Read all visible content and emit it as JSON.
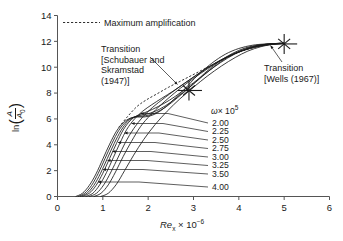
{
  "chart_data": {
    "type": "line",
    "title": "",
    "xlabel": "Re_x × 10⁻⁶",
    "ylabel": "ln(A/A₀)",
    "xlim": [
      0,
      6
    ],
    "ylim": [
      0,
      14
    ],
    "xticks": [
      "0",
      "1",
      "2",
      "3",
      "4",
      "5",
      "6"
    ],
    "yticks": [
      "0",
      "2",
      "4",
      "6",
      "8",
      "10",
      "12",
      "14"
    ],
    "grid": false,
    "legend_position": "top-left",
    "series_group_label": "ω × 10⁵",
    "series": [
      {
        "name": "2.00",
        "x": [
          0.4,
          0.55,
          0.7,
          0.85,
          1.0,
          1.15,
          1.3,
          1.45,
          1.6,
          1.75,
          1.9,
          2.1,
          2.3,
          2.55,
          2.8,
          3.1,
          3.4,
          3.7,
          4.0,
          4.3,
          4.6,
          5.0
        ],
        "values": [
          0.0,
          0.25,
          0.85,
          1.75,
          2.9,
          4.05,
          5.05,
          5.7,
          6.05,
          6.15,
          6.15,
          6.3,
          6.7,
          7.45,
          8.3,
          9.4,
          10.3,
          11.0,
          11.45,
          11.7,
          11.8,
          11.85
        ]
      },
      {
        "name": "2.25",
        "x": [
          0.45,
          0.6,
          0.75,
          0.9,
          1.05,
          1.2,
          1.35,
          1.5,
          1.65,
          1.8,
          1.95,
          2.15,
          2.4,
          2.65,
          2.95,
          3.25,
          3.55,
          3.85,
          4.15,
          4.45,
          4.75,
          5.0
        ],
        "values": [
          0.0,
          0.25,
          0.85,
          1.8,
          2.95,
          4.1,
          5.1,
          5.75,
          6.1,
          6.2,
          6.25,
          6.45,
          6.95,
          7.65,
          8.55,
          9.55,
          10.4,
          11.05,
          11.5,
          11.72,
          11.82,
          11.85
        ]
      },
      {
        "name": "2.50",
        "x": [
          0.5,
          0.65,
          0.8,
          0.95,
          1.1,
          1.25,
          1.4,
          1.55,
          1.7,
          1.85,
          2.0,
          2.25,
          2.5,
          2.75,
          3.05,
          3.35,
          3.65,
          3.95,
          4.25,
          4.55,
          4.8,
          5.0
        ],
        "values": [
          0.0,
          0.25,
          0.85,
          1.8,
          2.95,
          4.1,
          5.1,
          5.8,
          6.15,
          6.3,
          6.4,
          6.75,
          7.3,
          8.0,
          8.85,
          9.75,
          10.55,
          11.15,
          11.55,
          11.75,
          11.83,
          11.85
        ]
      },
      {
        "name": "2.75",
        "x": [
          0.55,
          0.7,
          0.85,
          1.0,
          1.15,
          1.3,
          1.45,
          1.6,
          1.75,
          1.9,
          2.1,
          2.35,
          2.6,
          2.85,
          3.15,
          3.45,
          3.75,
          4.05,
          4.35,
          4.62,
          4.85,
          5.0
        ],
        "values": [
          0.0,
          0.25,
          0.85,
          1.8,
          2.95,
          4.1,
          5.15,
          5.85,
          6.25,
          6.45,
          6.75,
          7.2,
          7.75,
          8.4,
          9.2,
          10.0,
          10.7,
          11.25,
          11.6,
          11.78,
          11.84,
          11.85
        ]
      },
      {
        "name": "3.00",
        "x": [
          0.62,
          0.78,
          0.93,
          1.08,
          1.23,
          1.38,
          1.53,
          1.7,
          1.88,
          2.08,
          2.3,
          2.55,
          2.8,
          3.05,
          3.35,
          3.65,
          3.95,
          4.25,
          4.5,
          4.75,
          5.0
        ],
        "values": [
          0.0,
          0.25,
          0.9,
          1.85,
          3.0,
          4.15,
          5.2,
          6.0,
          6.6,
          7.1,
          7.6,
          8.15,
          8.75,
          9.35,
          10.05,
          10.65,
          11.1,
          11.45,
          11.65,
          11.78,
          11.85
        ]
      },
      {
        "name": "3.25",
        "x": [
          0.7,
          0.86,
          1.02,
          1.18,
          1.34,
          1.5,
          1.68,
          1.88,
          2.1,
          2.35,
          2.6,
          2.88,
          3.15,
          3.45,
          3.75,
          4.05,
          4.32,
          4.58,
          4.8,
          5.0
        ],
        "values": [
          0.0,
          0.25,
          0.9,
          1.9,
          3.05,
          4.2,
          5.25,
          6.15,
          6.9,
          7.6,
          8.25,
          8.95,
          9.6,
          10.25,
          10.8,
          11.25,
          11.55,
          11.72,
          11.8,
          11.85
        ]
      },
      {
        "name": "3.50",
        "x": [
          0.8,
          0.96,
          1.12,
          1.28,
          1.45,
          1.63,
          1.83,
          2.05,
          2.3,
          2.58,
          2.85,
          3.15,
          3.45,
          3.75,
          4.05,
          4.32,
          4.58,
          4.8,
          5.0
        ],
        "values": [
          0.0,
          0.25,
          0.9,
          1.9,
          3.1,
          4.25,
          5.4,
          6.3,
          7.15,
          8.0,
          8.75,
          9.5,
          10.2,
          10.8,
          11.25,
          11.55,
          11.72,
          11.8,
          11.85
        ]
      },
      {
        "name": "4.00",
        "x": [
          0.95,
          1.12,
          1.3,
          1.48,
          1.68,
          1.9,
          2.15,
          2.42,
          2.7,
          3.0,
          3.3,
          3.62,
          3.92,
          4.2,
          4.48,
          4.72,
          5.0
        ],
        "values": [
          0.0,
          0.25,
          0.95,
          2.0,
          3.2,
          4.4,
          5.55,
          6.6,
          7.55,
          8.45,
          9.3,
          10.1,
          10.75,
          11.25,
          11.58,
          11.75,
          11.85
        ]
      }
    ],
    "envelope": {
      "name": "Maximum amplification",
      "style": "dashed",
      "x": [
        1.35,
        1.55,
        1.75,
        1.95,
        2.2,
        2.45,
        2.7,
        2.95,
        3.2,
        3.45,
        3.7,
        3.95,
        4.2,
        4.45,
        4.7,
        4.95
      ],
      "values": [
        5.35,
        6.2,
        6.95,
        7.45,
        7.95,
        8.45,
        8.9,
        9.35,
        9.8,
        10.25,
        10.7,
        11.1,
        11.4,
        11.62,
        11.78,
        11.87
      ]
    },
    "annotations": [
      {
        "id": "transition-schubauer",
        "text_lines": [
          "Transition",
          "[Schubauer and",
          "Skramstad",
          "(1947)]"
        ],
        "marker": "cross",
        "x": 2.9,
        "y": 8.2
      },
      {
        "id": "transition-wells",
        "text_lines": [
          "Transition",
          "[Wells (1967)]"
        ],
        "marker": "cross",
        "x": 5.0,
        "y": 11.8
      }
    ]
  },
  "legend": {
    "maximum_amplification": "Maximum amplification"
  },
  "annotation_text": {
    "schubauer_line1": "Transition",
    "schubauer_line2": "[Schubauer and",
    "schubauer_line3": "Skramstad",
    "schubauer_line4": "(1947)]",
    "wells_line1": "Transition",
    "wells_line2": "[Wells (1967)]"
  },
  "axis_text": {
    "x_symbol": "Re",
    "x_sub": "x",
    "x_times": " × 10",
    "x_exp": "−6",
    "y_prefix": "ln",
    "y_num": "A",
    "y_den": "A",
    "y_den_sub": "0"
  },
  "omega_group": {
    "symbol": "ω",
    "times": "× 10",
    "exp": "5",
    "labels": [
      "2.00",
      "2.25",
      "2.50",
      "2.75",
      "3.00",
      "3.25",
      "3.50",
      "4.00"
    ]
  }
}
